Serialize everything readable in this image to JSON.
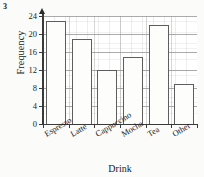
{
  "question_number": "3",
  "chart_data": {
    "type": "bar",
    "title": "",
    "xlabel": "Drink",
    "ylabel": "Frequency",
    "categories": [
      "Espresso",
      "Latte",
      "Cappuccino",
      "Mocha",
      "Tea",
      "Other"
    ],
    "values": [
      23,
      19,
      12,
      15,
      22,
      9
    ],
    "ylim": [
      0,
      24
    ],
    "yticks": [
      0,
      4,
      8,
      12,
      16,
      20,
      24
    ],
    "ytick_labels": [
      "0",
      "4",
      "8",
      "12",
      "16",
      "20",
      "24"
    ],
    "grid": true,
    "legend": null,
    "bar_fill_color": "#fdfdfc",
    "bar_edge_color": "#5e5e5e",
    "axis_color": "#3a3a3a",
    "grid_color": "#8f8f8f"
  }
}
